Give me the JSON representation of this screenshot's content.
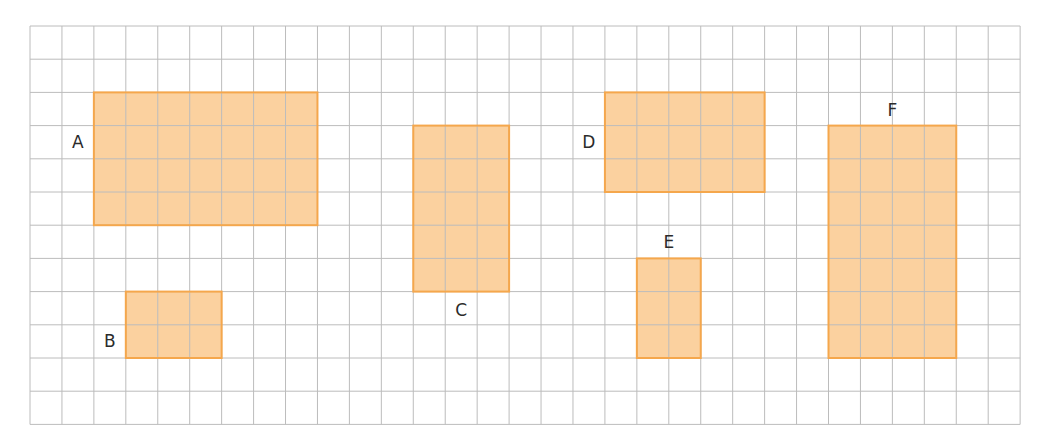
{
  "grid": {
    "columns": 31,
    "rows": 12
  },
  "colors": {
    "grid_line": "#bcbcbc",
    "shape_fill": "#fbd19f",
    "shape_border": "#f5a74c",
    "label": "#2b2b2b"
  },
  "shapes": [
    {
      "label": "A",
      "col": 2,
      "row": 2,
      "width": 7,
      "height": 4,
      "label_side": "left"
    },
    {
      "label": "B",
      "col": 3,
      "row": 8,
      "width": 3,
      "height": 2,
      "label_side": "left"
    },
    {
      "label": "C",
      "col": 12,
      "row": 3,
      "width": 3,
      "height": 5,
      "label_side": "below"
    },
    {
      "label": "D",
      "col": 18,
      "row": 2,
      "width": 5,
      "height": 3,
      "label_side": "left"
    },
    {
      "label": "E",
      "col": 19,
      "row": 7,
      "width": 2,
      "height": 3,
      "label_side": "above"
    },
    {
      "label": "F",
      "col": 25,
      "row": 3,
      "width": 4,
      "height": 7,
      "label_side": "above"
    }
  ]
}
